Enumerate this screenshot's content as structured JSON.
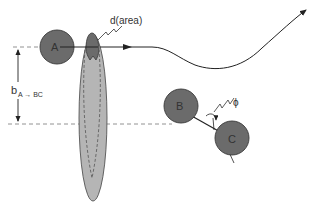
{
  "diagram": {
    "labels": {
      "atom_a": "A",
      "atom_b": "B",
      "atom_c": "C",
      "cross_section": "d(area)",
      "impact_parameter_main": "b",
      "impact_parameter_sub": "A → BC",
      "angle": "ϕ"
    },
    "colors": {
      "atom_fill": "#6b6b6b",
      "atom_stroke": "#3a3a3a",
      "ellipse_fill": "#b5b5b5",
      "area_fill": "#6b6b6b",
      "line": "#222222",
      "dash": "#777777"
    }
  }
}
